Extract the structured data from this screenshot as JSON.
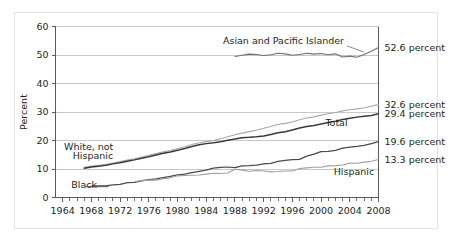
{
  "chart_data": {
    "type": "line",
    "title": "",
    "xlabel": "",
    "ylabel": "Percent",
    "xlim": [
      1963,
      2008
    ],
    "ylim": [
      0,
      60
    ],
    "ytick_values": [
      0,
      10,
      20,
      30,
      40,
      50,
      60
    ],
    "ytick_labels": [
      "0",
      "10",
      "20",
      "30",
      "40",
      "50",
      "60"
    ],
    "xtick_labels": [
      "1964",
      "1968",
      "1972",
      "1976",
      "1980",
      "1984",
      "1988",
      "1992",
      "1996",
      "2000",
      "2004",
      "2008"
    ],
    "xtick_values": [
      1964,
      1968,
      1972,
      1976,
      1980,
      1984,
      1988,
      1992,
      1996,
      2000,
      2004,
      2008
    ],
    "minor_xticks_every": 1,
    "grid": "horizontal",
    "legend_position": "inline-annotations",
    "series": [
      {
        "name": "Asian and Pacific Islander",
        "color": "#6f6f6f",
        "width": 1.1,
        "end_label": "52.6 percent",
        "end_value": 52.6,
        "label_x": 1998.5,
        "label_y": 55.0,
        "label_anchor": "end",
        "x": [
          1988,
          1989,
          1990,
          1991,
          1992,
          1993,
          1994,
          1995,
          1996,
          1997,
          1998,
          1999,
          2000,
          2001,
          2002,
          2003,
          2004,
          2005,
          2006,
          2007,
          2008
        ],
        "y": [
          49.5,
          49.9,
          50.3,
          50.2,
          49.8,
          50.1,
          50.6,
          50.4,
          49.9,
          50.2,
          50.6,
          50.3,
          50.5,
          50.1,
          50.4,
          49.3,
          49.6,
          49.2,
          50.2,
          51.3,
          52.6
        ]
      },
      {
        "name": "White, not Hispanic",
        "color": "#a8a8a8",
        "width": 1.1,
        "end_label": "32.6 percent",
        "end_value": 32.6,
        "label_x": 1965.0,
        "label_y": 18.0,
        "label_anchor": "start",
        "x": [
          1967,
          1968,
          1969,
          1970,
          1971,
          1972,
          1973,
          1974,
          1975,
          1976,
          1977,
          1978,
          1979,
          1980,
          1981,
          1982,
          1983,
          1984,
          1985,
          1986,
          1987,
          1988,
          1989,
          1990,
          1991,
          1992,
          1993,
          1994,
          1995,
          1996,
          1997,
          1998,
          1999,
          2000,
          2001,
          2002,
          2003,
          2004,
          2005,
          2006,
          2007,
          2008
        ],
        "y": [
          10.6,
          11.0,
          11.3,
          11.6,
          12.1,
          12.6,
          13.1,
          13.6,
          14.2,
          14.8,
          15.4,
          16.0,
          16.5,
          17.2,
          17.8,
          18.6,
          19.2,
          19.6,
          20.0,
          20.6,
          21.3,
          22.0,
          22.6,
          23.1,
          23.6,
          24.3,
          24.9,
          25.6,
          26.0,
          26.5,
          27.3,
          27.9,
          28.3,
          28.9,
          29.4,
          29.8,
          30.4,
          30.8,
          31.1,
          31.5,
          32.0,
          32.6
        ]
      },
      {
        "name": "Total",
        "color": "#3a3a3a",
        "width": 1.5,
        "end_label": "29.4 percent",
        "end_value": 29.4,
        "label_x": 2001.0,
        "label_y": 26.0,
        "label_anchor": "start",
        "x": [
          1967,
          1968,
          1969,
          1970,
          1971,
          1972,
          1973,
          1974,
          1975,
          1976,
          1977,
          1978,
          1979,
          1980,
          1981,
          1982,
          1983,
          1984,
          1985,
          1986,
          1987,
          1988,
          1989,
          1990,
          1991,
          1992,
          1993,
          1994,
          1995,
          1996,
          1997,
          1998,
          1999,
          2000,
          2001,
          2002,
          2003,
          2004,
          2005,
          2006,
          2007,
          2008
        ],
        "y": [
          10.3,
          10.7,
          11.0,
          11.3,
          11.8,
          12.2,
          12.7,
          13.2,
          13.8,
          14.3,
          14.9,
          15.5,
          16.0,
          16.6,
          17.2,
          17.9,
          18.5,
          18.9,
          19.2,
          19.6,
          20.1,
          20.5,
          21.0,
          21.1,
          21.3,
          21.6,
          22.1,
          22.7,
          23.1,
          23.7,
          24.4,
          24.9,
          25.3,
          25.8,
          26.3,
          26.8,
          27.4,
          27.8,
          28.2,
          28.5,
          28.8,
          29.4
        ]
      },
      {
        "name": "Black",
        "color": "#4a4a4a",
        "width": 1.25,
        "end_label": "19.6 percent",
        "end_value": 19.6,
        "label_x": 1966.2,
        "label_y": 4.6,
        "label_anchor": "start",
        "x": [
          1968,
          1969,
          1970,
          1971,
          1972,
          1973,
          1974,
          1975,
          1976,
          1977,
          1978,
          1979,
          1980,
          1981,
          1982,
          1983,
          1984,
          1985,
          1986,
          1987,
          1988,
          1989,
          1990,
          1991,
          1992,
          1993,
          1994,
          1995,
          1996,
          1997,
          1998,
          1999,
          2000,
          2001,
          2002,
          2003,
          2004,
          2005,
          2006,
          2007,
          2008
        ],
        "y": [
          4.0,
          4.1,
          4.1,
          4.4,
          4.6,
          5.2,
          5.3,
          5.8,
          6.3,
          6.5,
          7.0,
          7.4,
          7.9,
          8.2,
          8.7,
          9.2,
          9.6,
          10.3,
          10.6,
          10.7,
          10.5,
          11.1,
          11.2,
          11.4,
          11.8,
          12.0,
          12.7,
          13.0,
          13.3,
          13.4,
          14.5,
          15.2,
          16.1,
          16.2,
          16.5,
          17.3,
          17.7,
          17.9,
          18.3,
          18.9,
          19.6
        ]
      },
      {
        "name": "Hispanic",
        "color": "#a0a0a0",
        "width": 1.1,
        "end_label": "13.3 percent",
        "end_value": 13.3,
        "label_x": 2004.5,
        "label_y": 10.2,
        "label_anchor": "end",
        "x": [
          1974,
          1975,
          1976,
          1977,
          1978,
          1979,
          1980,
          1981,
          1982,
          1983,
          1984,
          1985,
          1986,
          1987,
          1988,
          1989,
          1990,
          1991,
          1992,
          1993,
          1994,
          1995,
          1996,
          1997,
          1998,
          1999,
          2000,
          2001,
          2002,
          2003,
          2004,
          2005,
          2006,
          2007,
          2008
        ],
        "y": [
          5.5,
          6.0,
          6.1,
          6.1,
          6.6,
          6.9,
          7.6,
          7.7,
          7.8,
          7.9,
          8.2,
          8.5,
          8.4,
          8.6,
          9.9,
          9.6,
          9.2,
          9.5,
          9.3,
          9.0,
          9.1,
          9.3,
          9.3,
          10.2,
          10.4,
          10.6,
          10.6,
          11.1,
          11.2,
          11.4,
          12.1,
          12.0,
          12.4,
          12.7,
          13.3
        ]
      }
    ],
    "right_labels": [
      {
        "text": "52.6 percent",
        "value": 52.6
      },
      {
        "text": "32.6 percent",
        "value": 32.6
      },
      {
        "text": "29.4 percent",
        "value": 29.4
      },
      {
        "text": "19.6 percent",
        "value": 19.6
      },
      {
        "text": "13.3 percent",
        "value": 13.3
      }
    ],
    "inline_labels": [
      {
        "text": "Asian and Pacific Islander"
      },
      {
        "text": "White, not"
      },
      {
        "text": "Hispanic"
      },
      {
        "text": "Total"
      },
      {
        "text": "Black"
      },
      {
        "text": "Hispanic"
      }
    ],
    "colors": {
      "axis": "#5a5a5a",
      "grid": "#b9b9b9",
      "frame_border": "#e3e3e3",
      "background": "#ffffff",
      "text": "#231f20"
    }
  }
}
